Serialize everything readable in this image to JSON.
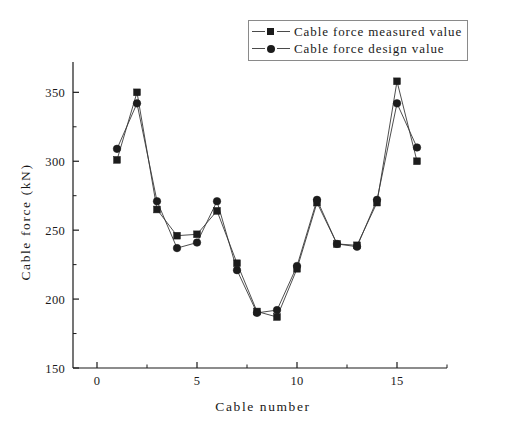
{
  "chart_data": {
    "type": "line",
    "title": "",
    "xlabel": "Cable number",
    "ylabel": "Cable force (kN)",
    "xlim": [
      -1.2,
      17.5
    ],
    "ylim": [
      150,
      372
    ],
    "grid": false,
    "legend_position": "top-right",
    "x": [
      1,
      2,
      3,
      4,
      5,
      6,
      7,
      8,
      9,
      10,
      11,
      12,
      13,
      14,
      15,
      16
    ],
    "categories": [
      "1",
      "2",
      "3",
      "4",
      "5",
      "6",
      "7",
      "8",
      "9",
      "10",
      "11",
      "12",
      "13",
      "14",
      "15",
      "16"
    ],
    "series": [
      {
        "name": "Cable force measured value",
        "marker": "square",
        "color": "#1c1c1c",
        "values": [
          301,
          350,
          265,
          246,
          247,
          264,
          226,
          191,
          187,
          222,
          270,
          240,
          239,
          270,
          358,
          300
        ]
      },
      {
        "name": "Cable force design value",
        "marker": "circle",
        "color": "#1c1c1c",
        "values": [
          309,
          342,
          271,
          237,
          241,
          271,
          221,
          190,
          192,
          224,
          272,
          240,
          238,
          272,
          342,
          310
        ]
      }
    ],
    "x_ticks_major": [
      0,
      5,
      10,
      15
    ],
    "x_tick_labels": [
      "0",
      "5",
      "10",
      "15"
    ],
    "x_ticks_minor": [
      2.5,
      7.5,
      12.5,
      17.5
    ],
    "y_ticks_major": [
      150,
      200,
      250,
      300,
      350
    ],
    "y_tick_labels": [
      "150",
      "200",
      "250",
      "300",
      "350"
    ],
    "y_ticks_minor": [
      175,
      225,
      275,
      325
    ]
  },
  "legend": {
    "items": [
      {
        "label": "Cable force measured value",
        "marker": "square"
      },
      {
        "label": "Cable force design value",
        "marker": "circle"
      }
    ]
  }
}
